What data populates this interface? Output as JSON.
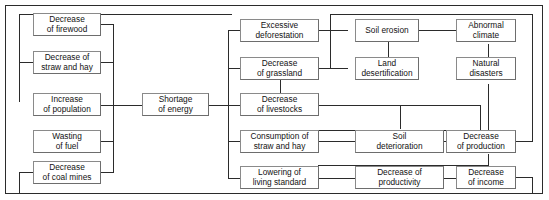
{
  "diagram": {
    "type": "flowchart",
    "frame": {
      "border_color": "#2b2b2b"
    },
    "node_style": {
      "border_color": "#6d6d6d",
      "fill": "#ffffff",
      "text_color": "#121212"
    },
    "nodes": [
      {
        "id": "firewood",
        "label": "Decrease\nof firewood"
      },
      {
        "id": "straw_hay",
        "label": "Decrease of\nstraw and hay"
      },
      {
        "id": "population",
        "label": "Increase\nof population"
      },
      {
        "id": "wasting_fuel",
        "label": "Wasting\nof fuel"
      },
      {
        "id": "coal_mines",
        "label": "Decrease\nof coal mines"
      },
      {
        "id": "shortage",
        "label": "Shortage\nof energy"
      },
      {
        "id": "deforestation",
        "label": "Excessive\ndeforestation"
      },
      {
        "id": "grassland",
        "label": "Decrease\nof grassland"
      },
      {
        "id": "livestocks",
        "label": "Decrease\nof livestocks"
      },
      {
        "id": "consumption",
        "label": "Consumption of\nstraw and hay"
      },
      {
        "id": "living_standard",
        "label": "Lowering of\nliving standard"
      },
      {
        "id": "soil_erosion",
        "label": "Soil erosion"
      },
      {
        "id": "desertification",
        "label": "Land\ndesertification"
      },
      {
        "id": "deterioration",
        "label": "Soil\ndeterioration"
      },
      {
        "id": "productivity",
        "label": "Decrease of\nproductivity"
      },
      {
        "id": "abnormal",
        "label": "Abnormal\nclimate"
      },
      {
        "id": "disasters",
        "label": "Natural\ndisasters"
      },
      {
        "id": "production",
        "label": "Decrease\nof production"
      },
      {
        "id": "income",
        "label": "Decrease\nof income"
      }
    ],
    "edges": [
      {
        "from": "firewood",
        "to": "shortage"
      },
      {
        "from": "straw_hay",
        "to": "shortage"
      },
      {
        "from": "population",
        "to": "shortage"
      },
      {
        "from": "wasting_fuel",
        "to": "shortage"
      },
      {
        "from": "coal_mines",
        "to": "shortage"
      },
      {
        "from": "shortage",
        "to": "deforestation"
      },
      {
        "from": "shortage",
        "to": "grassland"
      },
      {
        "from": "shortage",
        "to": "livestocks"
      },
      {
        "from": "shortage",
        "to": "consumption"
      },
      {
        "from": "shortage",
        "to": "living_standard"
      },
      {
        "from": "deforestation",
        "to": "soil_erosion"
      },
      {
        "from": "grassland",
        "to": "desertification"
      },
      {
        "from": "soil_erosion",
        "to": "abnormal"
      },
      {
        "from": "soil_erosion",
        "to": "desertification"
      },
      {
        "from": "desertification",
        "to": "abnormal"
      },
      {
        "from": "abnormal",
        "to": "disasters"
      },
      {
        "from": "disasters",
        "to": "production"
      },
      {
        "from": "grassland",
        "to": "livestocks"
      },
      {
        "from": "livestocks",
        "to": "production"
      },
      {
        "from": "consumption",
        "to": "deterioration"
      },
      {
        "from": "deterioration",
        "to": "production"
      },
      {
        "from": "living_standard",
        "to": "productivity"
      },
      {
        "from": "productivity",
        "to": "income"
      },
      {
        "from": "production",
        "to": "income"
      },
      {
        "from": "production",
        "to": "deforestation"
      },
      {
        "from": "income",
        "to": "coal_mines"
      },
      {
        "from": "deforestation",
        "to": "firewood"
      },
      {
        "from": "deforestation",
        "to": "straw_hay"
      }
    ]
  }
}
